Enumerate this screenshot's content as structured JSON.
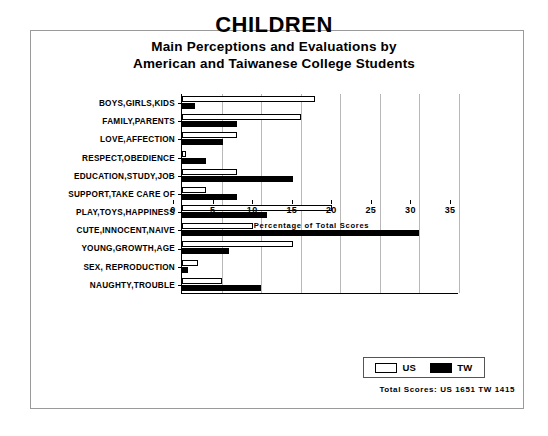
{
  "figure": {
    "title": "CHILDREN",
    "subtitle_line_1": "Main Perceptions and Evaluations by",
    "subtitle_line_2": "American and Taiwanese College Students",
    "totals_note": "Total Scores:  US 1651   TW 1415",
    "frame_color": "#9a9a9a"
  },
  "legend": {
    "us_label": "US",
    "tw_label": "TW",
    "us_color": "#ffffff",
    "tw_color": "#000000"
  },
  "chart_data": {
    "type": "bar",
    "orientation": "horizontal",
    "title": "CHILDREN",
    "subtitle": "Main Perceptions and Evaluations by American and Taiwanese College Students",
    "xlabel": "Percentage of Total Scores",
    "ylabel": "",
    "xlim": [
      0,
      35
    ],
    "xticks": [
      0,
      5,
      10,
      15,
      20,
      25,
      30,
      35
    ],
    "grid": true,
    "legend_position": "bottom-right",
    "categories": [
      "BOYS,GIRLS,KIDS",
      "FAMILY,PARENTS",
      "LOVE,AFFECTION",
      "RESPECT,OBEDIENCE",
      "EDUCATION,STUDY,JOB",
      "SUPPORT,TAKE CARE OF",
      "PLAY,TOYS,HAPPINESS",
      "CUTE,INNOCENT,NAIVE",
      "YOUNG,GROWTH,AGE",
      "SEX, REPRODUCTION",
      "NAUGHTY,TROUBLE"
    ],
    "series": [
      {
        "name": "US",
        "color": "#ffffff",
        "values": [
          16.8,
          15.0,
          7.0,
          0.5,
          7.0,
          3.0,
          19.0,
          9.0,
          14.0,
          2.0,
          5.0
        ]
      },
      {
        "name": "TW",
        "color": "#000000",
        "values": [
          1.7,
          7.0,
          5.2,
          3.0,
          14.0,
          7.0,
          10.8,
          30.0,
          6.0,
          0.8,
          10.0
        ]
      }
    ],
    "annotations": [
      "Total Scores:  US 1651   TW 1415"
    ]
  }
}
